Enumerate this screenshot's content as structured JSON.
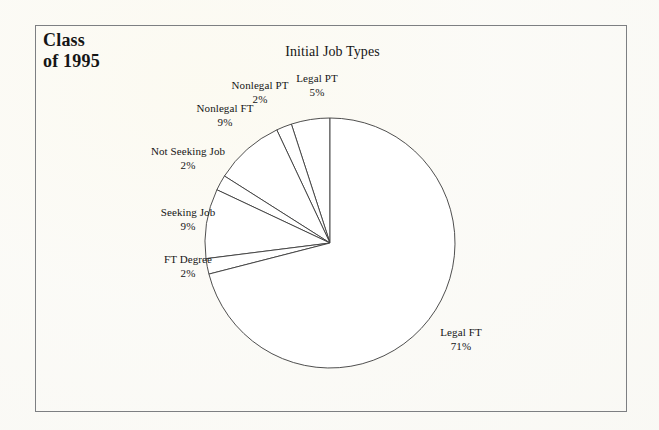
{
  "document": {
    "class_label": "Class\nof 1995"
  },
  "chart_data": {
    "type": "pie",
    "title": "Initial Job Types",
    "xlabel": "",
    "ylabel": "",
    "units": "percent",
    "start_angle_deg": 90,
    "direction": "counterclockwise",
    "legend": "none (direct slice labels)",
    "grid": false,
    "categories": [
      "Legal PT",
      "Nonlegal PT",
      "Nonlegal FT",
      "Not Seeking Job",
      "Seeking Job",
      "FT Degree",
      "Legal FT"
    ],
    "values": [
      5,
      2,
      9,
      2,
      9,
      2,
      71
    ],
    "slices": [
      {
        "label": "Legal PT",
        "value": 5,
        "percent_text": "5%"
      },
      {
        "label": "Nonlegal PT",
        "value": 2,
        "percent_text": "2%"
      },
      {
        "label": "Nonlegal FT",
        "value": 9,
        "percent_text": "9%"
      },
      {
        "label": "Not Seeking Job",
        "value": 2,
        "percent_text": "2%"
      },
      {
        "label": "Seeking Job",
        "value": 9,
        "percent_text": "9%"
      },
      {
        "label": "FT Degree",
        "value": 2,
        "percent_text": "2%"
      },
      {
        "label": "Legal FT",
        "value": 71,
        "percent_text": "71%"
      }
    ],
    "colors": {
      "slice_fill": "#ffffff",
      "slice_stroke": "#3b3b3b",
      "border": "#7d7f82",
      "text": "#151515",
      "background": "#fdfdfb"
    }
  }
}
